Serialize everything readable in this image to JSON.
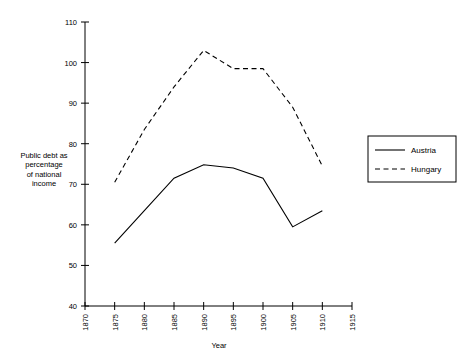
{
  "chart_data": {
    "type": "line",
    "title": "",
    "xlabel": "Year",
    "ylabel": "Public debt as percentage of national income",
    "ylabel_lines": [
      "Public debt as",
      "percentage",
      "of national",
      "income"
    ],
    "xlim": [
      1870,
      1915
    ],
    "ylim": [
      40,
      110
    ],
    "xticks": [
      1870,
      1875,
      1880,
      1885,
      1890,
      1895,
      1900,
      1905,
      1910,
      1915
    ],
    "yticks": [
      40,
      50,
      60,
      70,
      80,
      90,
      100,
      110
    ],
    "grid": false,
    "legend_position": "right",
    "x": [
      1875,
      1880,
      1885,
      1890,
      1895,
      1900,
      1905,
      1910
    ],
    "series": [
      {
        "name": "Austria",
        "style": "solid",
        "values": [
          55.5,
          63.5,
          71.5,
          74.8,
          74.0,
          71.5,
          59.5,
          63.5
        ]
      },
      {
        "name": "Hungary",
        "style": "dashed",
        "values": [
          70.5,
          83.5,
          94.0,
          103.0,
          98.5,
          98.5,
          89.0,
          74.5
        ]
      }
    ]
  },
  "axes": {
    "x_title": "Year",
    "x_tick_labels": [
      "1870",
      "1875",
      "1880",
      "1885",
      "1890",
      "1895",
      "1900",
      "1905",
      "1910",
      "1915"
    ],
    "y_tick_labels": [
      "40",
      "50",
      "60",
      "70",
      "80",
      "90",
      "100",
      "110"
    ],
    "y_title_lines": [
      "Public debt as",
      "percentage",
      "of national",
      "income"
    ]
  },
  "legend": {
    "entries": [
      {
        "label": "Austria",
        "style": "solid"
      },
      {
        "label": "Hungary",
        "style": "dashed"
      }
    ]
  },
  "colors": {
    "ink": "#000000",
    "background": "#ffffff"
  }
}
